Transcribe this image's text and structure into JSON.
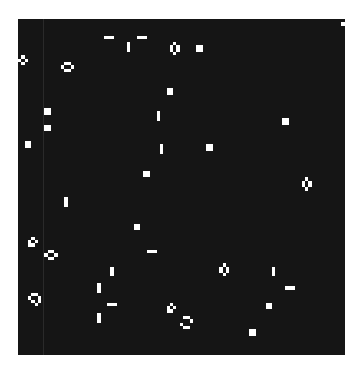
{
  "game": {
    "name": "Conway's Game of Life",
    "cell_size": 3.3,
    "colors": {
      "alive": "#ffffff",
      "dead": "#151515",
      "background": "#ffffff"
    },
    "live_cells": [
      [
        26,
        5
      ],
      [
        27,
        5
      ],
      [
        28,
        5
      ],
      [
        36,
        5
      ],
      [
        37,
        5
      ],
      [
        38,
        5
      ],
      [
        33,
        7
      ],
      [
        33,
        8
      ],
      [
        33,
        9
      ],
      [
        47,
        7
      ],
      [
        46,
        8
      ],
      [
        48,
        8
      ],
      [
        46,
        9
      ],
      [
        48,
        9
      ],
      [
        47,
        10
      ],
      [
        54,
        8
      ],
      [
        55,
        8
      ],
      [
        54,
        9
      ],
      [
        55,
        9
      ],
      [
        99,
        0
      ],
      [
        98,
        1
      ],
      [
        99,
        1
      ],
      [
        1,
        11
      ],
      [
        0,
        12
      ],
      [
        2,
        12
      ],
      [
        1,
        13
      ],
      [
        14,
        13
      ],
      [
        15,
        13
      ],
      [
        13,
        14
      ],
      [
        16,
        14
      ],
      [
        14,
        15
      ],
      [
        15,
        15
      ],
      [
        45,
        21
      ],
      [
        46,
        21
      ],
      [
        45,
        22
      ],
      [
        46,
        22
      ],
      [
        8,
        27
      ],
      [
        9,
        27
      ],
      [
        8,
        28
      ],
      [
        9,
        28
      ],
      [
        8,
        32
      ],
      [
        9,
        32
      ],
      [
        8,
        33
      ],
      [
        9,
        33
      ],
      [
        2,
        37
      ],
      [
        3,
        37
      ],
      [
        2,
        38
      ],
      [
        3,
        38
      ],
      [
        42,
        28
      ],
      [
        42,
        29
      ],
      [
        42,
        30
      ],
      [
        80,
        30
      ],
      [
        81,
        30
      ],
      [
        80,
        31
      ],
      [
        81,
        31
      ],
      [
        43,
        38
      ],
      [
        43,
        39
      ],
      [
        43,
        40
      ],
      [
        57,
        38
      ],
      [
        58,
        38
      ],
      [
        57,
        39
      ],
      [
        58,
        39
      ],
      [
        38,
        46
      ],
      [
        39,
        46
      ],
      [
        38,
        47
      ],
      [
        39,
        47
      ],
      [
        87,
        48
      ],
      [
        86,
        49
      ],
      [
        88,
        49
      ],
      [
        86,
        50
      ],
      [
        88,
        50
      ],
      [
        87,
        51
      ],
      [
        14,
        54
      ],
      [
        14,
        55
      ],
      [
        14,
        56
      ],
      [
        35,
        62
      ],
      [
        36,
        62
      ],
      [
        35,
        63
      ],
      [
        36,
        63
      ],
      [
        39,
        70
      ],
      [
        40,
        70
      ],
      [
        41,
        70
      ],
      [
        4,
        66
      ],
      [
        3,
        67
      ],
      [
        5,
        67
      ],
      [
        3,
        68
      ],
      [
        4,
        68
      ],
      [
        9,
        70
      ],
      [
        10,
        70
      ],
      [
        8,
        71
      ],
      [
        11,
        71
      ],
      [
        9,
        72
      ],
      [
        10,
        72
      ],
      [
        62,
        74
      ],
      [
        61,
        75
      ],
      [
        63,
        75
      ],
      [
        61,
        76
      ],
      [
        63,
        76
      ],
      [
        62,
        77
      ],
      [
        28,
        75
      ],
      [
        28,
        76
      ],
      [
        28,
        77
      ],
      [
        77,
        75
      ],
      [
        77,
        76
      ],
      [
        77,
        77
      ],
      [
        24,
        80
      ],
      [
        24,
        81
      ],
      [
        24,
        82
      ],
      [
        81,
        81
      ],
      [
        82,
        81
      ],
      [
        83,
        81
      ],
      [
        4,
        83
      ],
      [
        5,
        83
      ],
      [
        3,
        84
      ],
      [
        6,
        84
      ],
      [
        4,
        85
      ],
      [
        6,
        85
      ],
      [
        5,
        86
      ],
      [
        27,
        86
      ],
      [
        28,
        86
      ],
      [
        29,
        86
      ],
      [
        46,
        86
      ],
      [
        45,
        87
      ],
      [
        47,
        87
      ],
      [
        45,
        88
      ],
      [
        46,
        88
      ],
      [
        75,
        86
      ],
      [
        76,
        86
      ],
      [
        75,
        87
      ],
      [
        76,
        87
      ],
      [
        50,
        90
      ],
      [
        51,
        90
      ],
      [
        52,
        91
      ],
      [
        49,
        92
      ],
      [
        50,
        93
      ],
      [
        51,
        93
      ],
      [
        24,
        89
      ],
      [
        24,
        90
      ],
      [
        24,
        91
      ],
      [
        70,
        94
      ],
      [
        71,
        94
      ],
      [
        70,
        95
      ],
      [
        71,
        95
      ]
    ]
  }
}
